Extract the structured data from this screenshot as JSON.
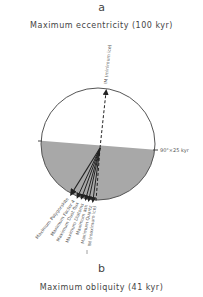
{
  "panel_a": {
    "letter": "a",
    "title": "Maximum eccentricity (100 kyr)",
    "top_arrow_label": "IM (minimum ice)",
    "right_marker_label": "90°×25 kyr",
    "bottom_arrow_labels": [
      "Maximum Palygorskite",
      "Maximum Factor 4",
      "Maximum Dust flux",
      "Maximum Diatoms",
      "Maximum ash",
      "Maximum Quartz",
      "IM (maximum ice)"
    ]
  },
  "panel_b": {
    "letter": "b",
    "title": "Maximum obliquity (41 kyr)"
  },
  "colors": {
    "shade": "#a8a8a8",
    "line": "#222222",
    "circle": "#555555"
  }
}
